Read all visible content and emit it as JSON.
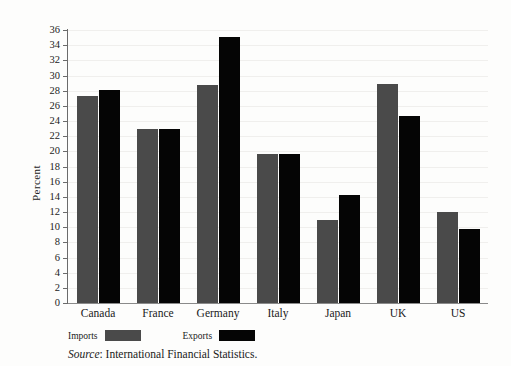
{
  "chart_data": {
    "type": "bar",
    "title": "",
    "xlabel": "",
    "ylabel": "Percent",
    "ylim": [
      0,
      36
    ],
    "ytick_step": 2,
    "grid": true,
    "legend_position": "below-left",
    "categories": [
      "Canada",
      "France",
      "Germany",
      "Italy",
      "Japan",
      "UK",
      "US"
    ],
    "yticks": [
      "0",
      "2",
      "4",
      "6",
      "8",
      "10",
      "12",
      "14",
      "16",
      "18",
      "20",
      "22",
      "24",
      "26",
      "28",
      "30",
      "32",
      "34",
      "36"
    ],
    "series": [
      {
        "name": "Imports",
        "color": "#4a4a4a",
        "values": [
          27.3,
          22.9,
          28.8,
          19.6,
          10.9,
          28.9,
          12.0
        ]
      },
      {
        "name": "Exports",
        "color": "#050505",
        "values": [
          28.1,
          23.0,
          35.1,
          19.6,
          14.2,
          24.6,
          9.7
        ]
      }
    ],
    "source": {
      "prefix": "Source",
      "separator": ": ",
      "text": "International Financial Statistics."
    }
  }
}
